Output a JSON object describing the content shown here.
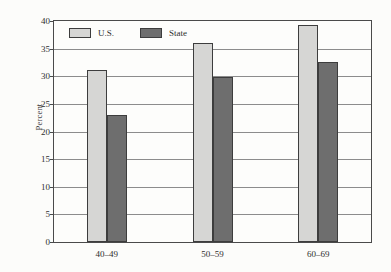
{
  "chart_data": {
    "type": "bar",
    "title": "",
    "subtitle": "",
    "xlabel": "",
    "ylabel": "Percent",
    "categories": [
      "40–49",
      "50–59",
      "60–69"
    ],
    "series": [
      {
        "name": "U.S.",
        "values": [
          31.2,
          36.1,
          39.3
        ],
        "color": "#d6d6d4"
      },
      {
        "name": "State",
        "values": [
          23.0,
          29.9,
          32.6
        ],
        "color": "#6e6e6e"
      }
    ],
    "ylim": [
      0,
      40
    ],
    "yticks": [
      0,
      5,
      10,
      15,
      20,
      25,
      30,
      35,
      40
    ],
    "ytick_labels": [
      "0",
      "5",
      "10",
      "15",
      "20",
      "25",
      "30",
      "35",
      "40"
    ],
    "grid": true,
    "grid_axis": "y",
    "legend_position": "upper left inside",
    "legend_entries": [
      "U.S.",
      "State"
    ],
    "annotations": []
  },
  "colors": {
    "us_bar": "#d6d6d4",
    "state_bar": "#6e6e6e",
    "bar_outline": "#3d3d3d",
    "gridline": "#8c8c8c",
    "frame": "#4a4a4a",
    "background": "#fcfcfa",
    "text": "#2e2e2e"
  }
}
